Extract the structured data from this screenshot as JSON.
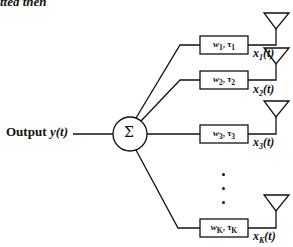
{
  "header": {
    "partial_text": "tted then"
  },
  "output": {
    "label": "Output",
    "signal": "y(t)"
  },
  "combiner": {
    "symbol": "Σ"
  },
  "branches": [
    {
      "weight": "w",
      "weight_sub": "1",
      "delay": "τ",
      "delay_sub": "1",
      "signal": "x",
      "signal_sub": "1",
      "signal_arg": "(t)"
    },
    {
      "weight": "w",
      "weight_sub": "2",
      "delay": "τ",
      "delay_sub": "2",
      "signal": "x",
      "signal_sub": "2",
      "signal_arg": "(t)"
    },
    {
      "weight": "w",
      "weight_sub": "3",
      "delay": "τ",
      "delay_sub": "3",
      "signal": "x",
      "signal_sub": "3",
      "signal_arg": "(t)"
    },
    {
      "weight": "w",
      "weight_sub": "K",
      "delay": "τ",
      "delay_sub": "K",
      "signal": "x",
      "signal_sub": "K",
      "signal_arg": "(t)"
    }
  ],
  "ellipsis": "⋮"
}
